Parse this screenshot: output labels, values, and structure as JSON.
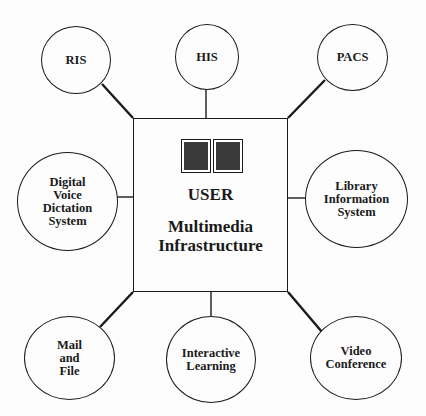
{
  "diagram": {
    "center": {
      "title": "USER",
      "subtitle": "Multimedia\nInfrastructure",
      "icon": "two-monitors-icon"
    },
    "nodes": [
      {
        "id": "ris",
        "label": "RIS"
      },
      {
        "id": "his",
        "label": "HIS"
      },
      {
        "id": "pacs",
        "label": "PACS"
      },
      {
        "id": "digital-voice",
        "label": "Digital\nVoice\nDictation\nSystem"
      },
      {
        "id": "library",
        "label": "Library\nInformation\nSystem"
      },
      {
        "id": "mail-file",
        "label": "Mail\nand\nFile"
      },
      {
        "id": "interactive-learning",
        "label": "Interactive\nLearning"
      },
      {
        "id": "video-conference",
        "label": "Video\nConference"
      }
    ],
    "edges": [
      {
        "from": "center",
        "to": "ris"
      },
      {
        "from": "center",
        "to": "his"
      },
      {
        "from": "center",
        "to": "pacs"
      },
      {
        "from": "center",
        "to": "digital-voice"
      },
      {
        "from": "center",
        "to": "library"
      },
      {
        "from": "center",
        "to": "mail-file"
      },
      {
        "from": "center",
        "to": "interactive-learning"
      },
      {
        "from": "center",
        "to": "video-conference"
      }
    ],
    "colors": {
      "line": "#1a1a1a",
      "background": "#fdfdfd",
      "screen": "#3a3a3a"
    }
  }
}
